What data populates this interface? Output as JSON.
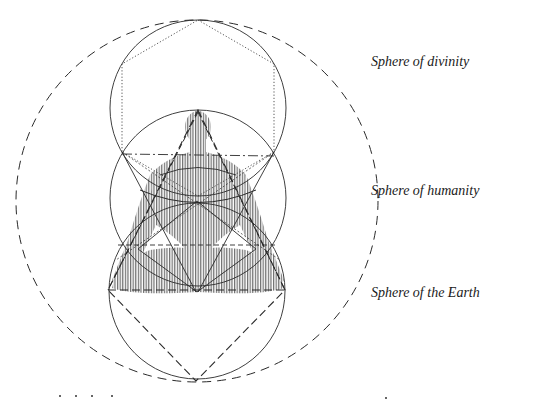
{
  "labels": {
    "divinity": "Sphere of divinity",
    "humanity": "Sphere of humanity",
    "earth": "Sphere of the Earth"
  },
  "colors": {
    "ink": "#2a2a2a",
    "figure": "#7a7a7a",
    "background": "#ffffff"
  }
}
